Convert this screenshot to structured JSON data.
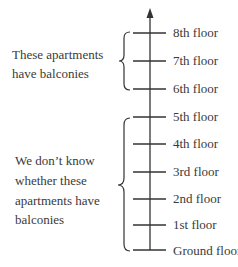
{
  "diagram": {
    "type": "floor-axis",
    "floors": [
      {
        "label": "8th floor"
      },
      {
        "label": "7th floor"
      },
      {
        "label": "6th floor"
      },
      {
        "label": "5th floor"
      },
      {
        "label": "4th floor"
      },
      {
        "label": "3rd floor"
      },
      {
        "label": "2nd floor"
      },
      {
        "label": "1st floor"
      },
      {
        "label": "Ground floor"
      }
    ],
    "groups": [
      {
        "name": "balconies-known",
        "from_floor": "6th floor",
        "to_floor": "8th floor",
        "lines": [
          "These apartments",
          "have balconies"
        ]
      },
      {
        "name": "balconies-unknown",
        "from_floor": "Ground floor",
        "to_floor": "5th floor",
        "lines": [
          "We don’t know",
          "whether these",
          "apartments have",
          "balconies"
        ]
      }
    ]
  }
}
